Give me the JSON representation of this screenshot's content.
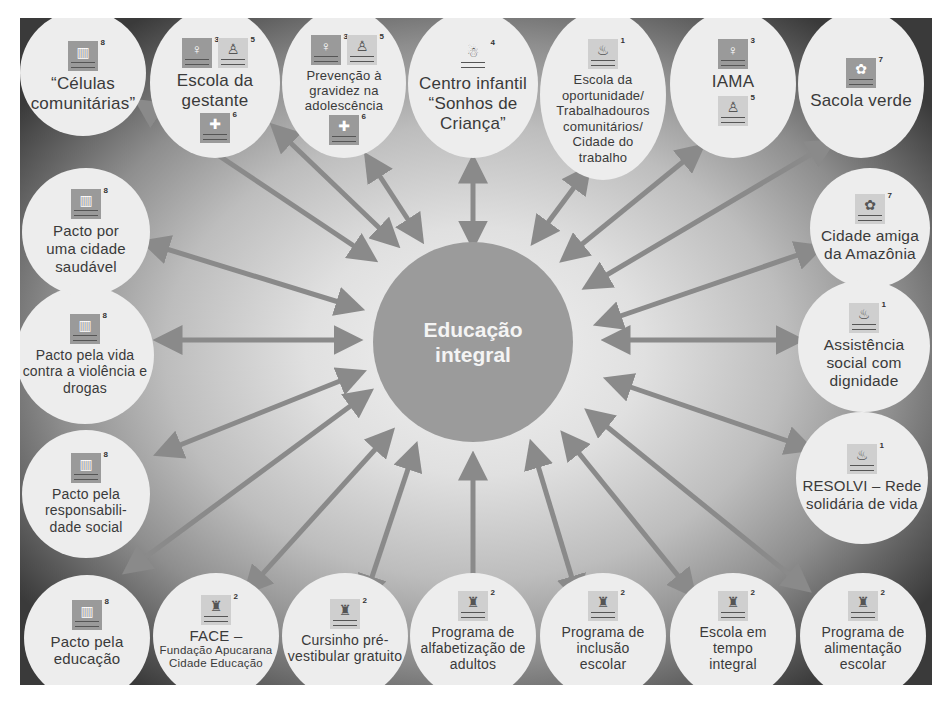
{
  "diagram": {
    "center": {
      "label_line1": "Educação",
      "label_line2": "integral"
    },
    "colors": {
      "center_fill": "#9b9b9b",
      "node_fill": "#ededed",
      "arrow": "#8a8a8a",
      "frame_dark": "#3a3a3a",
      "text": "#3a3a3a"
    },
    "nodes": [
      {
        "id": "celulas",
        "label": "“Células comunitárias”",
        "icons": [
          {
            "num": "8",
            "glyph": "▥"
          }
        ]
      },
      {
        "id": "escola-gestante",
        "label": "Escola da gestante",
        "icons": [
          {
            "num": "3",
            "glyph": "♀"
          },
          {
            "num": "5",
            "glyph": "♙"
          },
          {
            "num": "6",
            "glyph": "✚"
          }
        ]
      },
      {
        "id": "prevencao-gravidez",
        "label": "Prevenção à gravidez na adolescência",
        "icons": [
          {
            "num": "3",
            "glyph": "♀"
          },
          {
            "num": "5",
            "glyph": "♙"
          },
          {
            "num": "6",
            "glyph": "✚"
          }
        ]
      },
      {
        "id": "centro-infantil",
        "label": "Centro infantil “Sonhos de Criança”",
        "icons": [
          {
            "num": "4",
            "glyph": "☃"
          }
        ]
      },
      {
        "id": "escola-oportunidade",
        "label": "Escola da oportunidade/ Trabalhadouros comunitários/ Cidade do trabalho",
        "icons": [
          {
            "num": "1",
            "glyph": "♨"
          }
        ]
      },
      {
        "id": "iama",
        "label": "IAMA",
        "icons": [
          {
            "num": "3",
            "glyph": "♀"
          },
          {
            "num": "5",
            "glyph": "♙"
          }
        ]
      },
      {
        "id": "sacola-verde",
        "label": "Sacola verde",
        "icons": [
          {
            "num": "7",
            "glyph": "✿"
          }
        ]
      },
      {
        "id": "cidade-amazonia",
        "label": "Cidade amiga da Amazônia",
        "icons": [
          {
            "num": "7",
            "glyph": "✿"
          }
        ]
      },
      {
        "id": "assistencia-social",
        "label": "Assistência social com dignidade",
        "icons": [
          {
            "num": "1",
            "glyph": "♨"
          }
        ]
      },
      {
        "id": "resolvi",
        "label": "RESOLVI – Rede solidária de vida",
        "icons": [
          {
            "num": "1",
            "glyph": "♨"
          }
        ]
      },
      {
        "id": "alimentacao-escolar",
        "label": "Programa de alimentação escolar",
        "icons": [
          {
            "num": "2",
            "glyph": "♜"
          }
        ]
      },
      {
        "id": "escola-tempo-integral",
        "label": "Escola em tempo integral",
        "icons": [
          {
            "num": "2",
            "glyph": "♜"
          }
        ]
      },
      {
        "id": "inclusao-escolar",
        "label": "Programa de inclusão escolar",
        "icons": [
          {
            "num": "2",
            "glyph": "♜"
          }
        ]
      },
      {
        "id": "alfabetizacao-adultos",
        "label": "Programa de alfabetização de adultos",
        "icons": [
          {
            "num": "2",
            "glyph": "♜"
          }
        ]
      },
      {
        "id": "cursinho",
        "label": "Cursinho pré-vestibular gratuito",
        "icons": [
          {
            "num": "2",
            "glyph": "♜"
          }
        ]
      },
      {
        "id": "face",
        "label": "FACE –",
        "sublabel": "Fundação Apucarana Cidade Educação",
        "icons": [
          {
            "num": "2",
            "glyph": "♜"
          }
        ]
      },
      {
        "id": "pacto-educacao",
        "label": "Pacto pela educação",
        "icons": [
          {
            "num": "8",
            "glyph": "▥"
          }
        ]
      },
      {
        "id": "pacto-responsabilidade",
        "label": "Pacto pela responsabili-dade social",
        "icons": [
          {
            "num": "8",
            "glyph": "▥"
          }
        ]
      },
      {
        "id": "pacto-vida",
        "label": "Pacto pela vida contra a violência e drogas",
        "icons": [
          {
            "num": "8",
            "glyph": "▥"
          }
        ]
      },
      {
        "id": "pacto-cidade-saudavel",
        "label": "Pacto por uma cidade saudável",
        "icons": [
          {
            "num": "8",
            "glyph": "▥"
          }
        ]
      }
    ]
  }
}
